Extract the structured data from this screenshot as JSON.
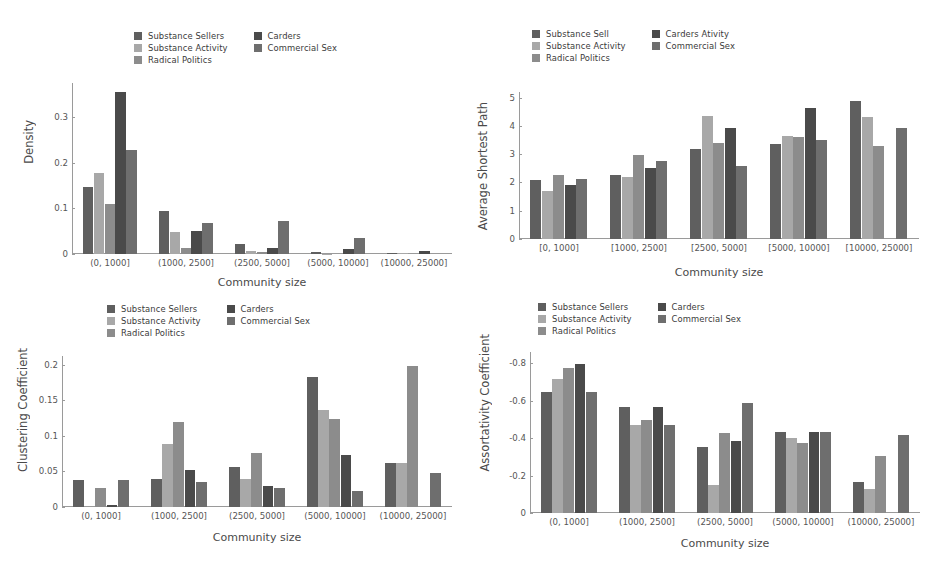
{
  "figure": {
    "background": "#ffffff",
    "cropped_title_fragment": ""
  },
  "palette": {
    "substance_sellers": "#5f5f5f",
    "substance_activity": "#a8a8a8",
    "radical_politics": "#8c8c8c",
    "carders": "#4a4a4a",
    "commercial_sex": "#6e6e6e",
    "axis": "#9a9a9a",
    "text": "#4a4a4a"
  },
  "panels": [
    {
      "id": "density",
      "legend": [
        {
          "label": "Substance Sellers",
          "color": "#5f5f5f",
          "icon": "legend-swatch"
        },
        {
          "label": "Substance Activity",
          "color": "#a8a8a8",
          "icon": "legend-swatch"
        },
        {
          "label": "Radical Politics",
          "color": "#8c8c8c",
          "icon": "legend-swatch"
        },
        {
          "label": "Carders",
          "color": "#4a4a4a",
          "icon": "legend-swatch"
        },
        {
          "label": "Commercial Sex",
          "color": "#6e6e6e",
          "icon": "legend-swatch"
        }
      ],
      "chart_data": {
        "type": "bar",
        "title": "",
        "xlabel": "Community size",
        "ylabel": "Density",
        "categories": [
          "(0, 1000]",
          "(1000, 2500]",
          "(2500, 5000]",
          "(5000, 10000]",
          "(10000, 25000]"
        ],
        "yticks": [
          "0",
          "0.1",
          "0.2",
          "0.3"
        ],
        "ytickvals": [
          0,
          0.1,
          0.2,
          0.3
        ],
        "ylim": [
          0,
          0.375
        ],
        "grid": false,
        "legend_position": "upper center",
        "series": [
          {
            "name": "Substance Sellers",
            "color": "#5f5f5f",
            "values": [
              0.147,
              0.095,
              0.022,
              0.004,
              0.003
            ]
          },
          {
            "name": "Substance Activity",
            "color": "#a8a8a8",
            "values": [
              0.178,
              0.048,
              0.006,
              0.001,
              0.002
            ]
          },
          {
            "name": "Radical Politics",
            "color": "#8c8c8c",
            "values": [
              0.11,
              0.013,
              0.005,
              0.0,
              0.0
            ]
          },
          {
            "name": "Carders",
            "color": "#4a4a4a",
            "values": [
              0.355,
              0.051,
              0.014,
              0.01,
              0.007
            ]
          },
          {
            "name": "Commercial Sex",
            "color": "#6e6e6e",
            "values": [
              0.229,
              0.068,
              0.072,
              0.036,
              0.0
            ]
          }
        ]
      }
    },
    {
      "id": "average-shortest-path",
      "legend": [
        {
          "label": "Substance Sell",
          "color": "#5f5f5f",
          "icon": "legend-swatch"
        },
        {
          "label": "Substance Activity",
          "color": "#a8a8a8",
          "icon": "legend-swatch"
        },
        {
          "label": "Radical Politics",
          "color": "#8c8c8c",
          "icon": "legend-swatch"
        },
        {
          "label": "Carders Ativity",
          "color": "#4a4a4a",
          "icon": "legend-swatch"
        },
        {
          "label": "Commercial Sex",
          "color": "#6e6e6e",
          "icon": "legend-swatch"
        }
      ],
      "chart_data": {
        "type": "bar",
        "title": "",
        "xlabel": "Community size",
        "ylabel": "Average Shortest Path",
        "categories": [
          "[0, 1000]",
          "[1000, 2500]",
          "[2500, 5000]",
          "[5000, 10000]",
          "[10000, 25000]"
        ],
        "yticks": [
          "0",
          "1",
          "2",
          "3",
          "4",
          "5"
        ],
        "ytickvals": [
          0,
          1,
          2,
          3,
          4,
          5
        ],
        "ylim": [
          0,
          5.2
        ],
        "grid": false,
        "legend_position": "upper center",
        "series": [
          {
            "name": "Substance Sell",
            "color": "#5f5f5f",
            "values": [
              2.1,
              2.28,
              3.17,
              3.36,
              4.88
            ]
          },
          {
            "name": "Substance Activity",
            "color": "#a8a8a8",
            "values": [
              1.7,
              2.2,
              4.35,
              3.66,
              4.33
            ]
          },
          {
            "name": "Radical Politics",
            "color": "#8c8c8c",
            "values": [
              2.27,
              2.96,
              3.4,
              3.62,
              3.28
            ]
          },
          {
            "name": "Carders Ativity",
            "color": "#4a4a4a",
            "values": [
              1.9,
              2.52,
              3.93,
              4.62,
              0.0
            ]
          },
          {
            "name": "Commercial Sex",
            "color": "#6e6e6e",
            "values": [
              2.13,
              2.77,
              2.59,
              3.51,
              3.92
            ]
          }
        ]
      }
    },
    {
      "id": "clustering-coefficient",
      "legend": [
        {
          "label": "Substance Sellers",
          "color": "#5f5f5f",
          "icon": "legend-swatch"
        },
        {
          "label": "Substance Activity",
          "color": "#a8a8a8",
          "icon": "legend-swatch"
        },
        {
          "label": "Radical Politics",
          "color": "#8c8c8c",
          "icon": "legend-swatch"
        },
        {
          "label": "Carders",
          "color": "#4a4a4a",
          "icon": "legend-swatch"
        },
        {
          "label": "Commercial Sex",
          "color": "#6e6e6e",
          "icon": "legend-swatch"
        }
      ],
      "chart_data": {
        "type": "bar",
        "title": "",
        "xlabel": "Community size",
        "ylabel": "Clustering Coefficient",
        "categories": [
          "(0, 1000]",
          "(1000, 2500]",
          "(2500, 5000]",
          "(5000, 10000]",
          "(10000, 25000]"
        ],
        "yticks": [
          "0",
          "0.05",
          "0.1",
          "0.15",
          "0.2"
        ],
        "ytickvals": [
          0,
          0.05,
          0.1,
          0.15,
          0.2
        ],
        "ylim": [
          0,
          0.212
        ],
        "grid": false,
        "legend_position": "upper center",
        "series": [
          {
            "name": "Substance Sellers",
            "color": "#5f5f5f",
            "values": [
              0.038,
              0.04,
              0.056,
              0.183,
              0.062
            ]
          },
          {
            "name": "Substance Activity",
            "color": "#a8a8a8",
            "values": [
              0.0,
              0.089,
              0.039,
              0.136,
              0.062
            ]
          },
          {
            "name": "Radical Politics",
            "color": "#8c8c8c",
            "values": [
              0.027,
              0.119,
              0.076,
              0.123,
              0.198
            ]
          },
          {
            "name": "Carders",
            "color": "#4a4a4a",
            "values": [
              0.003,
              0.052,
              0.029,
              0.073,
              0.0
            ]
          },
          {
            "name": "Commercial Sex",
            "color": "#6e6e6e",
            "values": [
              0.038,
              0.035,
              0.026,
              0.023,
              0.048
            ]
          }
        ]
      }
    },
    {
      "id": "assortativity-coefficient",
      "legend": [
        {
          "label": "Substance Sellers",
          "color": "#5f5f5f",
          "icon": "legend-swatch"
        },
        {
          "label": "Substance Activity",
          "color": "#a8a8a8",
          "icon": "legend-swatch"
        },
        {
          "label": "Radical Politics",
          "color": "#8c8c8c",
          "icon": "legend-swatch"
        },
        {
          "label": "Carders",
          "color": "#4a4a4a",
          "icon": "legend-swatch"
        },
        {
          "label": "Commercial Sex",
          "color": "#6e6e6e",
          "icon": "legend-swatch"
        }
      ],
      "chart_data": {
        "type": "bar",
        "title": "",
        "xlabel": "Community size",
        "ylabel": "Assortativity Coefficient",
        "categories": [
          "(0, 1000]",
          "(1000, 2500]",
          "(2500, 5000]",
          "(5000, 10000]",
          "(10000, 25000]"
        ],
        "yticks": [
          "0",
          "-0.2",
          "-0.4",
          "-0.6",
          "-0.8"
        ],
        "ytickvals": [
          0,
          -0.2,
          -0.4,
          -0.6,
          -0.8
        ],
        "ylim": [
          0,
          -0.86
        ],
        "axis_inverted": true,
        "grid": false,
        "legend_position": "upper center",
        "series": [
          {
            "name": "Substance Sellers",
            "color": "#5f5f5f",
            "values": [
              -0.645,
              -0.565,
              -0.355,
              -0.435,
              -0.165
            ]
          },
          {
            "name": "Substance Activity",
            "color": "#a8a8a8",
            "values": [
              -0.715,
              -0.47,
              -0.148,
              -0.4,
              -0.128
            ]
          },
          {
            "name": "Radical Politics",
            "color": "#8c8c8c",
            "values": [
              -0.775,
              -0.498,
              -0.425,
              -0.372,
              -0.305
            ]
          },
          {
            "name": "Carders",
            "color": "#4a4a4a",
            "values": [
              -0.795,
              -0.565,
              -0.385,
              -0.435,
              0.0
            ]
          },
          {
            "name": "Commercial Sex",
            "color": "#6e6e6e",
            "values": [
              -0.648,
              -0.47,
              -0.585,
              -0.435,
              -0.415
            ]
          }
        ]
      }
    }
  ]
}
